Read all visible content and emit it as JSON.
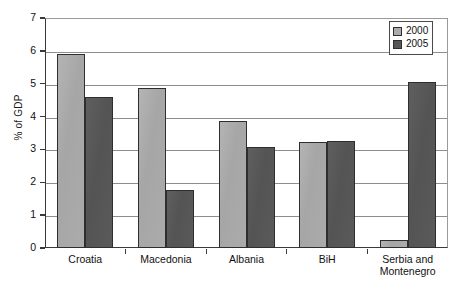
{
  "chart_data": {
    "type": "bar",
    "title": "",
    "xlabel": "",
    "ylabel": "% of GDP",
    "ylim": [
      0,
      7
    ],
    "y_ticks": [
      0,
      1,
      2,
      3,
      4,
      5,
      6,
      7
    ],
    "grid": true,
    "legend_position": "top-right",
    "categories": [
      "Croatia",
      "Macedonia",
      "Albania",
      "BiH",
      "Serbia and Montenegro"
    ],
    "category_lines": [
      [
        "Croatia"
      ],
      [
        "Macedonia"
      ],
      [
        "Albania"
      ],
      [
        "BiH"
      ],
      [
        "Serbia and",
        "Montenegro"
      ]
    ],
    "series": [
      {
        "name": "2000",
        "color": "#ababab",
        "values": [
          5.9,
          4.88,
          3.86,
          3.23,
          0.24
        ]
      },
      {
        "name": "2005",
        "color": "#575757",
        "values": [
          4.6,
          1.78,
          3.06,
          3.27,
          5.05
        ]
      }
    ]
  },
  "legend": {
    "entries": [
      {
        "label": "2000"
      },
      {
        "label": "2005"
      }
    ]
  },
  "colors": {
    "series_2000": "#ababab",
    "series_2005": "#575757",
    "axis": "#3a3a3a",
    "gridline": "#8d8d8d",
    "text": "#111111",
    "background": "#ffffff"
  }
}
